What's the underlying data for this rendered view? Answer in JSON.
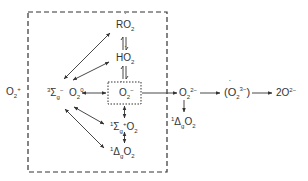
{
  "diagram": {
    "colors": {
      "ink": "#333333",
      "background": "#ffffff"
    },
    "outer": {
      "label_base": "O",
      "label_sub": "2",
      "label_sup": "+"
    },
    "frame": {
      "style": "dashed"
    },
    "species": {
      "ro2": {
        "prefix": "R",
        "base": "O",
        "sub": "2",
        "dotted": true
      },
      "ho2": {
        "prefix": "H",
        "base": "O",
        "sub": "2",
        "dotted": true
      },
      "triplet": {
        "left_sup": "3",
        "base": "Σ",
        "sub": "g",
        "sup": "−"
      },
      "o2_ground": {
        "base": "O",
        "sub": "2",
        "sup": "0"
      },
      "superoxide": {
        "base": "O",
        "sub": "2",
        "sup": "−",
        "dotted": true,
        "boxed": true
      },
      "singlet_sigma": {
        "left_sup": "1",
        "base": "Σ",
        "sub": "g",
        "sup": "+",
        "suffix_base": "O",
        "suffix_sub": "2"
      },
      "singlet_delta_in": {
        "left_sup": "1",
        "base": "Δ",
        "sub": "g",
        "suffix_base": "O",
        "suffix_sub": "2"
      },
      "peroxide": {
        "base": "O",
        "sub": "2",
        "sup": "2−"
      },
      "singlet_delta_out": {
        "left_sup": "1",
        "base": "Δ",
        "sub": "g",
        "suffix_base": "O",
        "suffix_sub": "2"
      },
      "trioxide_radical": {
        "open": "(",
        "base": "O",
        "sub": "2",
        "sup": "3−",
        "dotted": true,
        "close": ")"
      },
      "oxide": {
        "coef": "2",
        "base": "O",
        "sup": "2−"
      }
    }
  }
}
